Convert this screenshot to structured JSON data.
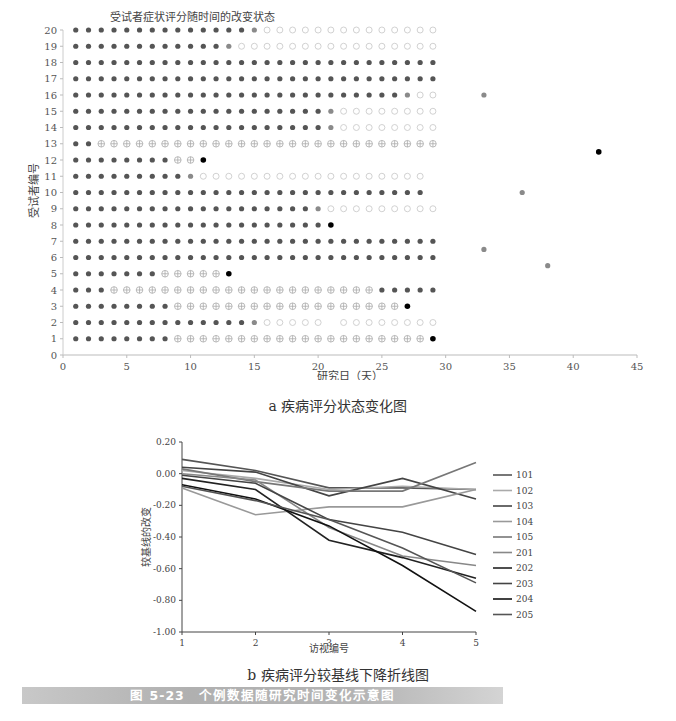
{
  "chart_data": [
    {
      "type": "scatter",
      "panel": "a",
      "title": "受试者症状评分随时间的改变状态",
      "xlabel": "研究日（天）",
      "ylabel": "受试者编号",
      "xlim": [
        0,
        45
      ],
      "ylim": [
        0,
        20
      ],
      "xticks": [
        0,
        5,
        10,
        15,
        20,
        25,
        30,
        35,
        40,
        45
      ],
      "yticks": [
        0,
        1,
        2,
        3,
        4,
        5,
        6,
        7,
        8,
        9,
        10,
        11,
        12,
        13,
        14,
        15,
        16,
        17,
        18,
        19,
        20
      ],
      "grid": false,
      "marker_legend": {
        "F": "filled dark circle",
        "G": "filled grey circle",
        "O": "open circle",
        "X": "crossed circle",
        "B": "black dot"
      },
      "rows": [
        {
          "subject": 20,
          "segments": [
            [
              "F",
              1,
              14
            ],
            [
              "G",
              15,
              15
            ],
            [
              "O",
              16,
              29
            ]
          ]
        },
        {
          "subject": 19,
          "segments": [
            [
              "F",
              1,
              12
            ],
            [
              "G",
              13,
              13
            ],
            [
              "O",
              14,
              29
            ]
          ]
        },
        {
          "subject": 18,
          "segments": [
            [
              "F",
              1,
              29
            ]
          ]
        },
        {
          "subject": 17,
          "segments": [
            [
              "F",
              1,
              29
            ]
          ]
        },
        {
          "subject": 16,
          "segments": [
            [
              "F",
              1,
              26
            ],
            [
              "G",
              27,
              27
            ],
            [
              "O",
              28,
              29
            ]
          ]
        },
        {
          "subject": 15,
          "segments": [
            [
              "F",
              1,
              20
            ],
            [
              "G",
              21,
              21
            ],
            [
              "O",
              22,
              29
            ]
          ]
        },
        {
          "subject": 14,
          "segments": [
            [
              "F",
              1,
              20
            ],
            [
              "G",
              21,
              21
            ],
            [
              "O",
              22,
              29
            ]
          ]
        },
        {
          "subject": 13,
          "segments": [
            [
              "F",
              1,
              2
            ],
            [
              "X",
              3,
              29
            ]
          ]
        },
        {
          "subject": 12,
          "segments": [
            [
              "F",
              1,
              8
            ],
            [
              "X",
              9,
              10
            ],
            [
              "B",
              11,
              11
            ]
          ]
        },
        {
          "subject": 11,
          "segments": [
            [
              "F",
              1,
              9
            ],
            [
              "G",
              10,
              10
            ],
            [
              "O",
              11,
              28
            ]
          ]
        },
        {
          "subject": 10,
          "segments": [
            [
              "F",
              1,
              28
            ]
          ]
        },
        {
          "subject": 9,
          "segments": [
            [
              "F",
              1,
              19
            ],
            [
              "G",
              20,
              20
            ],
            [
              "O",
              21,
              29
            ]
          ]
        },
        {
          "subject": 8,
          "segments": [
            [
              "F",
              1,
              20
            ],
            [
              "B",
              21,
              21
            ]
          ]
        },
        {
          "subject": 7,
          "segments": [
            [
              "F",
              1,
              29
            ]
          ]
        },
        {
          "subject": 6,
          "segments": [
            [
              "F",
              1,
              29
            ]
          ]
        },
        {
          "subject": 5,
          "segments": [
            [
              "F",
              1,
              7
            ],
            [
              "X",
              8,
              12
            ],
            [
              "B",
              13,
              13
            ]
          ]
        },
        {
          "subject": 4,
          "segments": [
            [
              "F",
              1,
              3
            ],
            [
              "X",
              4,
              24
            ],
            [
              "F",
              25,
              29
            ]
          ]
        },
        {
          "subject": 3,
          "segments": [
            [
              "F",
              1,
              8
            ],
            [
              "X",
              9,
              26
            ],
            [
              "B",
              27,
              27
            ]
          ]
        },
        {
          "subject": 2,
          "segments": [
            [
              "F",
              1,
              14
            ],
            [
              "G",
              15,
              15
            ],
            [
              "O",
              16,
              20
            ],
            [
              "O",
              22,
              29
            ]
          ]
        },
        {
          "subject": 1,
          "segments": [
            [
              "F",
              1,
              8
            ],
            [
              "X",
              9,
              28
            ],
            [
              "B",
              29,
              29
            ]
          ]
        }
      ],
      "extra_points": [
        {
          "x": 33,
          "y": 16,
          "marker": "G"
        },
        {
          "x": 42,
          "y": 12.5,
          "marker": "B"
        },
        {
          "x": 36,
          "y": 10,
          "marker": "G"
        },
        {
          "x": 33,
          "y": 6.5,
          "marker": "G"
        },
        {
          "x": 38,
          "y": 5.5,
          "marker": "G"
        }
      ]
    },
    {
      "type": "line",
      "panel": "b",
      "title": "",
      "xlabel": "访视编号",
      "ylabel": "较基线的改变",
      "x": [
        1,
        2,
        3,
        4,
        5
      ],
      "xlim": [
        1,
        5
      ],
      "ylim": [
        -1.0,
        0.2
      ],
      "yticks": [
        "0.20",
        "0.00",
        "-0.20",
        "-0.40",
        "-0.60",
        "-0.80",
        "-1.00"
      ],
      "xticks": [
        "1",
        "2",
        "3",
        "4",
        "5"
      ],
      "grid": false,
      "legend_position": "right",
      "series": [
        {
          "name": "101",
          "color": "#555555",
          "values": [
            0.09,
            0.02,
            -0.09,
            -0.09,
            -0.1
          ]
        },
        {
          "name": "102",
          "color": "#aaaaaa",
          "values": [
            0.02,
            -0.03,
            -0.1,
            -0.08,
            -0.1
          ]
        },
        {
          "name": "103",
          "color": "#444444",
          "values": [
            0.04,
            0.01,
            -0.14,
            -0.03,
            -0.16
          ]
        },
        {
          "name": "104",
          "color": "#999999",
          "values": [
            -0.09,
            -0.26,
            -0.21,
            -0.21,
            -0.1
          ]
        },
        {
          "name": "105",
          "color": "#777777",
          "values": [
            0.03,
            -0.05,
            -0.11,
            -0.11,
            0.07
          ]
        },
        {
          "name": "201",
          "color": "#888888",
          "values": [
            0.0,
            -0.04,
            -0.34,
            -0.52,
            -0.58
          ]
        },
        {
          "name": "202",
          "color": "#222222",
          "values": [
            -0.03,
            -0.1,
            -0.42,
            -0.53,
            -0.66
          ]
        },
        {
          "name": "203",
          "color": "#444444",
          "values": [
            -0.01,
            -0.06,
            -0.29,
            -0.37,
            -0.51
          ]
        },
        {
          "name": "204",
          "color": "#111111",
          "values": [
            -0.07,
            -0.16,
            -0.33,
            -0.58,
            -0.87
          ]
        },
        {
          "name": "205",
          "color": "#555555",
          "values": [
            -0.08,
            -0.17,
            -0.29,
            -0.47,
            -0.69
          ]
        }
      ]
    }
  ],
  "captions": {
    "a": "a 疾病评分状态变化图",
    "b": "b 疾病评分较基线下降折线图",
    "figure_number": "图 5-23",
    "figure_title": "个例数据随研究时间变化示意图"
  }
}
